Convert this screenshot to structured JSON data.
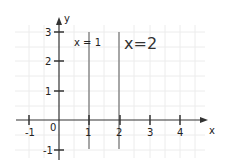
{
  "diagram": {
    "type": "coordinate-plane",
    "axes": {
      "x_label": "x",
      "y_label": "y"
    },
    "x_ticks": [
      "-1",
      "0",
      "1",
      "2",
      "3",
      "4"
    ],
    "y_ticks": [
      "3",
      "2",
      "1",
      "-1"
    ],
    "lines": [
      {
        "label": "x = 1",
        "x": 1
      },
      {
        "label": "x=2",
        "x": 2
      }
    ],
    "colors": {
      "axis": "#333333",
      "line": "#888888",
      "grid": "#e8e8e8"
    }
  }
}
